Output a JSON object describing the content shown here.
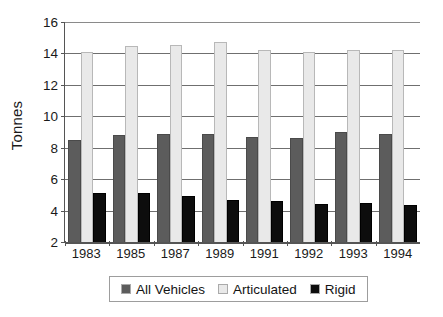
{
  "chart_data": {
    "type": "bar",
    "title": "",
    "subtitle": "",
    "xlabel": "",
    "ylabel": "Tonnes",
    "categories": [
      "1983",
      "1985",
      "1987",
      "1989",
      "1991",
      "1992",
      "1993",
      "1994"
    ],
    "series": [
      {
        "name": "All Vehicles",
        "color": "#5c5c5c",
        "values": [
          8.5,
          8.8,
          8.85,
          8.9,
          8.7,
          8.6,
          9.0,
          8.85
        ]
      },
      {
        "name": "Articulated",
        "color": "#e9e9e9",
        "values": [
          14.1,
          14.5,
          14.55,
          14.75,
          14.2,
          14.1,
          14.2,
          14.25
        ]
      },
      {
        "name": "Rigid",
        "color": "#0d0d0d",
        "values": [
          5.1,
          5.1,
          4.9,
          4.7,
          4.6,
          4.45,
          4.5,
          4.35
        ]
      }
    ],
    "ylim": [
      2,
      16
    ],
    "yticks": [
      2,
      4,
      6,
      8,
      10,
      12,
      14,
      16
    ],
    "ytick_labels": [
      "2",
      "4",
      "6",
      "8",
      "10",
      "12",
      "14",
      "16"
    ],
    "grid": true,
    "grid_axis": "y",
    "legend_position": "bottom",
    "legend_entries": [
      "All Vehicles",
      "Articulated",
      "Rigid"
    ]
  }
}
